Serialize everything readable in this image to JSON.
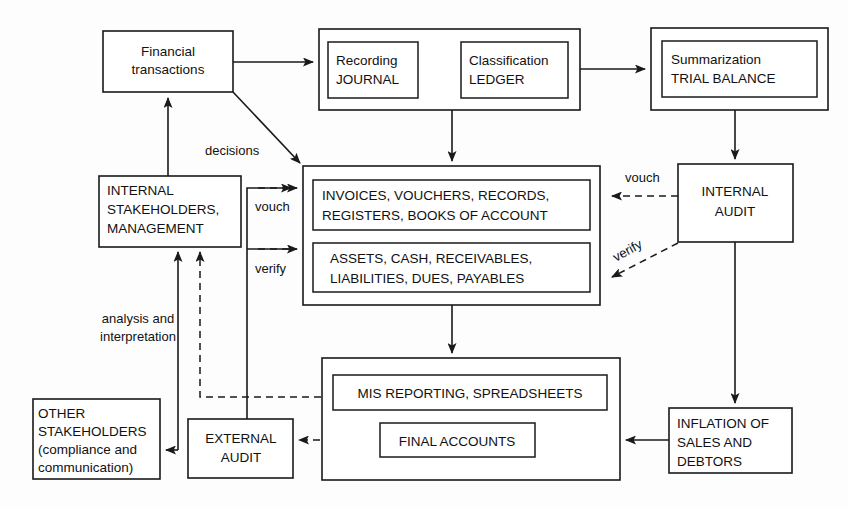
{
  "diagram": {
    "colors": {
      "line": "#1a1a1a",
      "box_fill": "#ffffff",
      "page": "#fdfdfd",
      "text": "#111111"
    },
    "nodes": {
      "financial_transactions": {
        "lines": [
          "Financial",
          "transactions"
        ]
      },
      "process_group": {
        "label": ""
      },
      "recording_journal": {
        "lines": [
          "Recording",
          "JOURNAL"
        ]
      },
      "classification_ledger": {
        "lines": [
          "Classification",
          "LEDGER"
        ]
      },
      "summarization_trial_balance": {
        "lines": [
          "Summarization",
          "TRIAL BALANCE"
        ]
      },
      "internal_stakeholders": {
        "lines": [
          "INTERNAL",
          "STAKEHOLDERS,",
          "MANAGEMENT"
        ]
      },
      "records_group": {
        "label": ""
      },
      "invoices_records": {
        "lines": [
          "INVOICES, VOUCHERS, RECORDS,",
          "REGISTERS, BOOKS OF ACCOUNT"
        ]
      },
      "assets_liabilities": {
        "lines": [
          "ASSETS, CASH, RECEIVABLES,",
          "LIABILITIES, DUES, PAYABLES"
        ]
      },
      "internal_audit": {
        "lines": [
          "INTERNAL",
          "AUDIT"
        ]
      },
      "reporting_group": {
        "label": ""
      },
      "mis_reporting": {
        "lines": [
          "MIS REPORTING, SPREADSHEETS"
        ]
      },
      "final_accounts": {
        "lines": [
          "FINAL ACCOUNTS"
        ]
      },
      "inflation_of_sales": {
        "lines": [
          "INFLATION OF",
          "SALES AND",
          "DEBTORS"
        ]
      },
      "external_audit": {
        "lines": [
          "EXTERNAL",
          "AUDIT"
        ]
      },
      "other_stakeholders": {
        "lines": [
          "OTHER",
          "STAKEHOLDERS",
          "(compliance and",
          "communication)"
        ]
      }
    },
    "edge_labels": {
      "decisions": "decisions",
      "vouch_left": "vouch",
      "verify_left": "verify",
      "vouch_right": "vouch",
      "verify_right": "verify",
      "analysis": [
        "analysis and",
        "interpretation"
      ]
    }
  }
}
